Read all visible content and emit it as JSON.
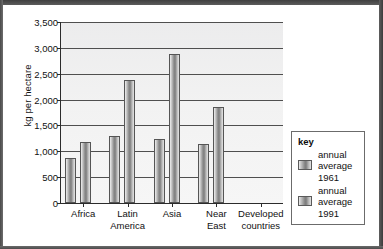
{
  "axis": {
    "y_label": "kg per hectare",
    "y_ticks": [
      "3,500",
      "3,000",
      "2,500",
      "2,000",
      "1,500",
      "1,000",
      "500",
      "0"
    ]
  },
  "legend": {
    "title": "key",
    "entries": [
      {
        "label": "annual\naverage\n1961",
        "swatch_name": "legend-swatch-1961"
      },
      {
        "label": "annual\naverage\n1991",
        "swatch_name": "legend-swatch-1991"
      }
    ]
  },
  "categories_display": [
    "Africa",
    "Latin\nAmerica",
    "Asia",
    "Near\nEast",
    "Developed\ncountries"
  ],
  "colors": {
    "bar_dark": "#7d7d7d",
    "bar_light": "#efefef",
    "gridline": "#4f4f4f",
    "axis": "#2b2b2b",
    "plot_background": "#f2f2f2",
    "legend_border": "#6b6b6b",
    "scan_border": "#4a4a4a"
  },
  "chart_data": {
    "type": "bar",
    "title": "",
    "xlabel": "",
    "ylabel": "kg per hectare",
    "categories": [
      "Africa",
      "Latin America",
      "Asia",
      "Near East",
      "Developed countries"
    ],
    "series": [
      {
        "name": "annual average 1961",
        "values": [
          870,
          1300,
          1230,
          1150,
          null
        ]
      },
      {
        "name": "annual average 1991",
        "values": [
          1180,
          2370,
          2890,
          1850,
          null
        ]
      }
    ],
    "ylim": [
      0,
      3500
    ],
    "ytick_values": [
      0,
      500,
      1000,
      1500,
      2000,
      2500,
      3000,
      3500
    ],
    "grid": true,
    "legend_position": "right"
  }
}
